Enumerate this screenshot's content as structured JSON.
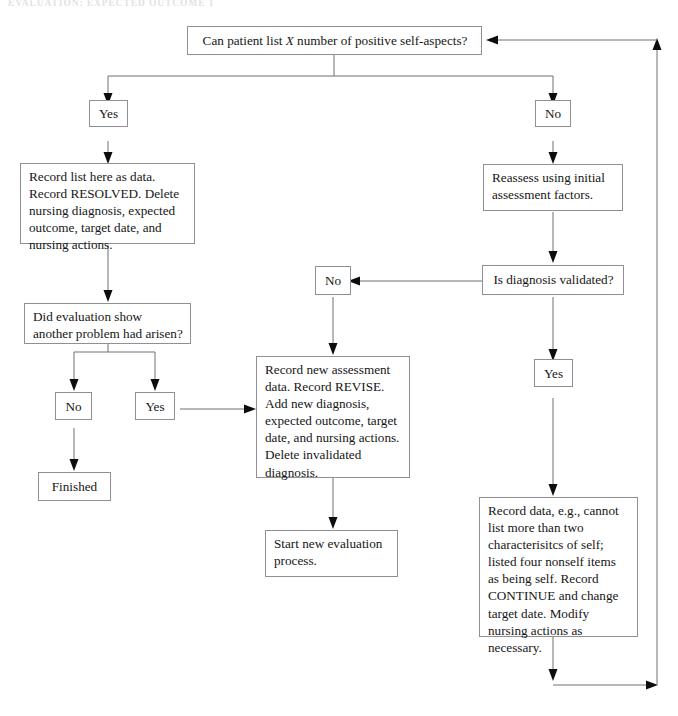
{
  "page": {
    "running_head": "EVALUATION: EXPECTED OUTCOME 1",
    "width": 678,
    "height": 716,
    "background": "#ffffff",
    "line_color": "#707076",
    "border_color": "#8f8f95",
    "text_color": "#161616"
  },
  "nodes": {
    "question_top": {
      "id": "can-patient-list",
      "text_before_italic": "Can patient list ",
      "italic": "X",
      "text_after_italic": " number of positive self-aspects?",
      "full_text": "Can patient list X number of positive self-aspects?"
    },
    "branch_yes_left": {
      "id": "yes-left",
      "label": "Yes"
    },
    "branch_no_right": {
      "id": "no-right",
      "label": "No"
    },
    "record_resolved": {
      "id": "record-resolved",
      "label": "Record list here as data. Record RESOLVED. Delete nursing diagnosis, expected outcome, target date, and nursing actions."
    },
    "reassess": {
      "id": "reassess-initial",
      "label": "Reassess using initial assessment factors."
    },
    "did_evaluation": {
      "id": "did-evaluation-show",
      "label": "Did evaluation show another problem had arisen?"
    },
    "is_validated": {
      "id": "is-diagnosis-validated",
      "label": "Is diagnosis validated?"
    },
    "validated_no": {
      "id": "validated-no",
      "label": "No"
    },
    "validated_yes": {
      "id": "validated-yes",
      "label": "Yes"
    },
    "eval_no": {
      "id": "evaluation-no",
      "label": "No"
    },
    "eval_yes": {
      "id": "evaluation-yes",
      "label": "Yes"
    },
    "finished": {
      "id": "finished",
      "label": "Finished"
    },
    "record_revise": {
      "id": "record-revise",
      "label": "Record new assessment data. Record REVISE. Add new diagnosis, expected outcome, target date, and nursing actions. Delete invalidated diagnosis."
    },
    "start_new": {
      "id": "start-new-evaluation",
      "label": "Start new evaluation process."
    },
    "record_continue": {
      "id": "record-continue",
      "label": "Record data, e.g., cannot list more than two characterisitcs of self; listed four nonself items as being self.  Record CONTINUE and change target date. Modify nursing actions as necessary."
    }
  },
  "connectors": [
    {
      "id": "top-split-to-yes",
      "from": "question_top",
      "to": "branch_yes_left"
    },
    {
      "id": "top-split-to-no",
      "from": "question_top",
      "to": "branch_no_right"
    },
    {
      "id": "yes-to-record-resolved",
      "from": "branch_yes_left",
      "to": "record_resolved"
    },
    {
      "id": "record-resolved-to-did-evaluation",
      "from": "record_resolved",
      "to": "did_evaluation"
    },
    {
      "id": "did-evaluation-to-no",
      "from": "did_evaluation",
      "to": "eval_no"
    },
    {
      "id": "did-evaluation-to-yes",
      "from": "did_evaluation",
      "to": "eval_yes"
    },
    {
      "id": "eval-no-to-finished",
      "from": "eval_no",
      "to": "finished"
    },
    {
      "id": "eval-yes-to-record-revise",
      "from": "eval_yes",
      "to": "record_revise"
    },
    {
      "id": "no-to-reassess",
      "from": "branch_no_right",
      "to": "reassess"
    },
    {
      "id": "reassess-to-is-validated",
      "from": "reassess",
      "to": "is_validated"
    },
    {
      "id": "is-validated-to-no",
      "from": "is_validated",
      "to": "validated_no"
    },
    {
      "id": "is-validated-to-yes",
      "from": "is_validated",
      "to": "validated_yes"
    },
    {
      "id": "validated-no-to-record-revise",
      "from": "validated_no",
      "to": "record_revise"
    },
    {
      "id": "validated-yes-to-record-continue",
      "from": "validated_yes",
      "to": "record_continue"
    },
    {
      "id": "record-revise-to-start-new",
      "from": "record_revise",
      "to": "start_new"
    },
    {
      "id": "record-continue-loop-back",
      "from": "record_continue",
      "to": "question_top"
    }
  ]
}
